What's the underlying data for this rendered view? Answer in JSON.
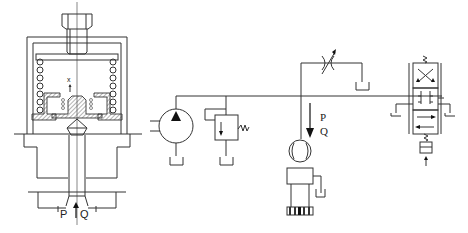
{
  "figure": {
    "left_panel": {
      "name": "pressure-reducing-valve-cross-section",
      "labels": {
        "displacement": "x",
        "pressure": "P",
        "flow": "Q"
      }
    },
    "right_panel": {
      "name": "hydraulic-circuit-schematic",
      "labels": {
        "pressure": "P",
        "flow": "Q"
      },
      "components": [
        "pump",
        "relief-valve",
        "adjustable-throttle-valve",
        "flow-meter",
        "test-valve",
        "solenoid-directional-valve",
        "tank"
      ]
    },
    "colors": {
      "line": "#333333",
      "background": "#ffffff"
    }
  }
}
